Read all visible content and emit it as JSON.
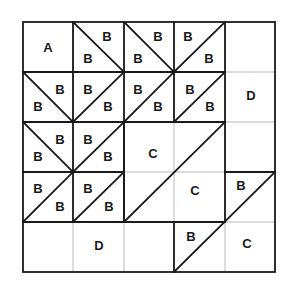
{
  "diagram": {
    "type": "quilt-block",
    "grid": {
      "cols": 5,
      "rows": 5
    },
    "colors": {
      "thick_line": "#1a1a1a",
      "thin_line": "#b8b8b8",
      "background": "#ffffff"
    },
    "labels": [
      {
        "id": "a",
        "text": "A",
        "x": 48,
        "y": 47
      },
      {
        "id": "b1",
        "text": "B",
        "x": 107,
        "y": 36
      },
      {
        "id": "b2",
        "text": "B",
        "x": 88,
        "y": 58
      },
      {
        "id": "b3",
        "text": "B",
        "x": 158,
        "y": 36
      },
      {
        "id": "b4",
        "text": "B",
        "x": 138,
        "y": 58
      },
      {
        "id": "b5",
        "text": "B",
        "x": 188,
        "y": 36
      },
      {
        "id": "b6",
        "text": "B",
        "x": 209,
        "y": 58
      },
      {
        "id": "b7",
        "text": "B",
        "x": 60,
        "y": 89
      },
      {
        "id": "b8",
        "text": "B",
        "x": 38,
        "y": 106
      },
      {
        "id": "b9",
        "text": "B",
        "x": 88,
        "y": 89
      },
      {
        "id": "b10",
        "text": "B",
        "x": 108,
        "y": 106
      },
      {
        "id": "b11",
        "text": "B",
        "x": 138,
        "y": 89
      },
      {
        "id": "b12",
        "text": "B",
        "x": 158,
        "y": 106
      },
      {
        "id": "b13",
        "text": "B",
        "x": 190,
        "y": 89
      },
      {
        "id": "b14",
        "text": "B",
        "x": 210,
        "y": 106
      },
      {
        "id": "d1",
        "text": "D",
        "x": 251,
        "y": 95
      },
      {
        "id": "b15",
        "text": "B",
        "x": 60,
        "y": 139
      },
      {
        "id": "b16",
        "text": "B",
        "x": 38,
        "y": 156
      },
      {
        "id": "b17",
        "text": "B",
        "x": 88,
        "y": 139
      },
      {
        "id": "b18",
        "text": "B",
        "x": 108,
        "y": 156
      },
      {
        "id": "c1",
        "text": "C",
        "x": 153,
        "y": 153
      },
      {
        "id": "b19",
        "text": "B",
        "x": 38,
        "y": 188
      },
      {
        "id": "b20",
        "text": "B",
        "x": 60,
        "y": 206
      },
      {
        "id": "b21",
        "text": "B",
        "x": 88,
        "y": 188
      },
      {
        "id": "b22",
        "text": "B",
        "x": 109,
        "y": 206
      },
      {
        "id": "c2",
        "text": "C",
        "x": 195,
        "y": 190
      },
      {
        "id": "b23",
        "text": "B",
        "x": 241,
        "y": 185
      },
      {
        "id": "d2",
        "text": "D",
        "x": 99,
        "y": 245
      },
      {
        "id": "b24",
        "text": "B",
        "x": 191,
        "y": 236
      },
      {
        "id": "c3",
        "text": "C",
        "x": 247,
        "y": 243
      }
    ]
  }
}
